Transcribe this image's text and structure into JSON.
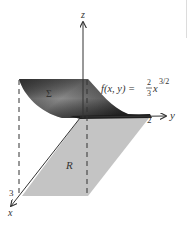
{
  "figure": {
    "axes": {
      "x_label": "x",
      "y_label": "y",
      "z_label": "z",
      "x_tick": "3",
      "y_tick": "2"
    },
    "surface": {
      "label": "Σ",
      "formula": {
        "lhs": "f(x, y) =",
        "frac_num": "2",
        "frac_den": "3",
        "var": "x",
        "exponent": "3/2"
      },
      "color_dark": "#3a3a3a",
      "color_light": "#a8a8a8"
    },
    "region": {
      "label": "R",
      "color": "#c4c4c4"
    },
    "axis_color": "#333333"
  }
}
